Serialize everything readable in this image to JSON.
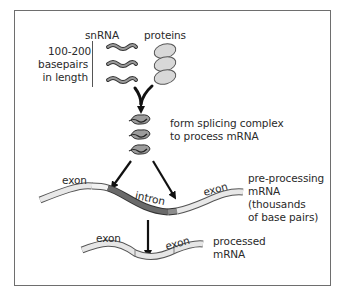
{
  "diagram": {
    "title_snrna": "snRNA",
    "title_proteins": "proteins",
    "snrna_length_note": [
      "100-200",
      "basepairs",
      "in length"
    ],
    "complex_label": [
      "form splicing complex",
      "to process mRNA"
    ],
    "pre_mrna_label": [
      "pre-processing",
      "mRNA",
      "(thousands",
      "of base pairs)"
    ],
    "processed_label": [
      "processed",
      "mRNA"
    ],
    "segments": {
      "exon_left": "exon",
      "intron": "intron",
      "exon_right": "exon",
      "processed_exon_left": "exon",
      "processed_exon_right": "exon"
    },
    "colors": {
      "frame": "#6e6e6e",
      "exon_fill": "#e6e6e6",
      "intron_fill": "#6a6a6a",
      "snrna": "#7a7a7a",
      "protein": "#d4d4d4",
      "arrow": "#111111",
      "text": "#2a2a2a"
    }
  }
}
